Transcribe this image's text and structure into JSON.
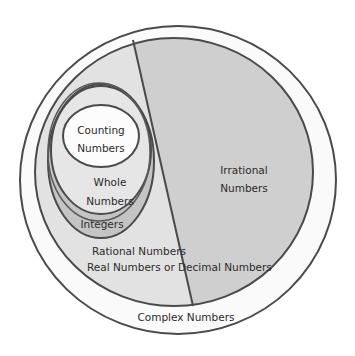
{
  "diagram": {
    "type": "nested-venn",
    "sets": {
      "complex": {
        "label": "Complex Numbers"
      },
      "real": {
        "label": "Real Numbers or Decimal Numbers"
      },
      "rational": {
        "label": "Rational Numbers"
      },
      "irrational": {
        "label_line1": "Irrational",
        "label_line2": "Numbers"
      },
      "integers": {
        "label": "Integers"
      },
      "whole": {
        "label_line1": "Whole",
        "label_line2": "Numbers"
      },
      "counting": {
        "label_line1": "Counting",
        "label_line2": "Numbers"
      }
    },
    "colors": {
      "stroke": "#4a4a4a",
      "complex_fill": "#fafafa",
      "rational_fill": "#e2e2e2",
      "irrational_fill": "#cfcfcf",
      "integers_fill": "#c4c4c4",
      "whole_fill": "#e6e6e6",
      "counting_fill": "#fcfcfc"
    }
  }
}
